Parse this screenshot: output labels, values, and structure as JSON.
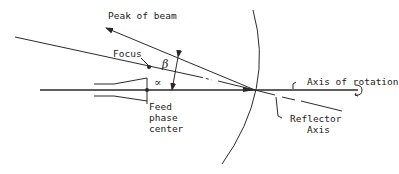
{
  "diagram": {
    "labels": {
      "peak_of_beam": "Peak of beam",
      "focus": "Focus",
      "beta": "β",
      "alpha": "∝",
      "feed_line1": "Feed",
      "feed_line2": "phase",
      "feed_line3": "center",
      "axis_of_rotation": "Axis of rotation",
      "reflector_line1": "Reflector",
      "reflector_line2": "Axis"
    },
    "colors": {
      "line": "#2a2a2a",
      "background": "#ffffff"
    }
  }
}
